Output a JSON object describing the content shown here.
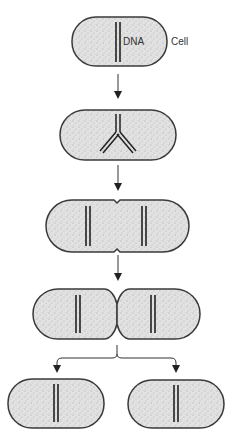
{
  "diagram": {
    "labels": {
      "dna": "DNA",
      "cell": "Cell"
    },
    "colors": {
      "cell_fill": "#dcdcdc",
      "cell_stroke": "#3a3a3a",
      "dna": "#222222",
      "arrow": "#333333"
    },
    "stages": [
      {
        "id": 1,
        "description": "Parent cell with single circular DNA chromosome"
      },
      {
        "id": 2,
        "description": "DNA replication begins (replication fork)"
      },
      {
        "id": 3,
        "description": "Cell elongates; two DNA copies separate"
      },
      {
        "id": 4,
        "description": "Septum forms dividing the cell"
      },
      {
        "id": 5,
        "description": "Two identical daughter cells"
      }
    ]
  }
}
